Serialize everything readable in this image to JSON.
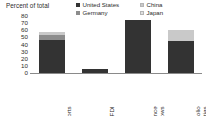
{
  "chart_data": {
    "type": "bar",
    "subtype": "stacked-column",
    "title": "Percent of total",
    "xlabel": "",
    "ylabel": "",
    "ylim": [
      0,
      80
    ],
    "yticks": [
      0,
      10,
      20,
      30,
      40,
      50,
      60,
      70,
      80
    ],
    "ytick_labels": [
      "0",
      "10",
      "20",
      "30",
      "40",
      "50",
      "60",
      "70",
      "80"
    ],
    "grid": false,
    "legend_position": "top-right",
    "categories": [
      "Exports",
      "Inward FDI",
      "Remittance inflows",
      "Portfolio liabilities"
    ],
    "category_lines": [
      [
        "Exports"
      ],
      [
        "Inward FDI"
      ],
      [
        "Remittance",
        "inflows"
      ],
      [
        "Portfolio",
        "liabilities"
      ]
    ],
    "series": [
      {
        "name": "United States",
        "color": "#333333",
        "values": [
          47,
          5,
          75,
          45
        ]
      },
      {
        "name": "Germany",
        "color": "#8c8c8c",
        "values": [
          6,
          0,
          0,
          0
        ]
      },
      {
        "name": "China",
        "color": "#c9c9c9",
        "values": [
          4,
          0,
          0,
          15
        ]
      },
      {
        "name": "Japan",
        "color": "#e0e0e0",
        "values": [
          0,
          0,
          0,
          0
        ]
      }
    ],
    "totals": [
      57,
      5,
      75,
      60
    ]
  },
  "legend": {
    "entries": [
      {
        "label": "United States",
        "color": "#333333"
      },
      {
        "label": "China",
        "color": "#c9c9c9"
      },
      {
        "label": "Germany",
        "color": "#8c8c8c"
      },
      {
        "label": "Japan",
        "color": "#e0e0e0"
      }
    ]
  }
}
